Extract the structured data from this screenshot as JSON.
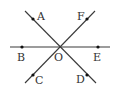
{
  "diagram": {
    "type": "intersecting-lines",
    "center": {
      "label": "O",
      "x": 60,
      "y": 47
    },
    "lines": [
      {
        "name": "line-BE",
        "from": [
          10,
          47
        ],
        "to": [
          110,
          47
        ],
        "through": [
          "B",
          "O",
          "E"
        ]
      },
      {
        "name": "line-AD",
        "from": [
          25,
          11
        ],
        "to": [
          96,
          83
        ],
        "through": [
          "A",
          "O",
          "D"
        ]
      },
      {
        "name": "line-FC",
        "from": [
          95,
          11
        ],
        "to": [
          25,
          83
        ],
        "through": [
          "F",
          "O",
          "C"
        ]
      }
    ],
    "points": [
      {
        "label": "A",
        "x": 33,
        "y": 19,
        "lx": 40,
        "ly": 19
      },
      {
        "label": "F",
        "x": 87,
        "y": 19,
        "lx": 80,
        "ly": 19
      },
      {
        "label": "B",
        "x": 22,
        "y": 47,
        "lx": 21,
        "ly": 61
      },
      {
        "label": "E",
        "x": 98,
        "y": 47,
        "lx": 98,
        "ly": 61
      },
      {
        "label": "C",
        "x": 33,
        "y": 75,
        "lx": 38,
        "ly": 84
      },
      {
        "label": "D",
        "x": 87,
        "y": 75,
        "lx": 79,
        "ly": 83
      }
    ],
    "labels": {
      "A": "A",
      "F": "F",
      "B": "B",
      "O": "O",
      "E": "E",
      "C": "C",
      "D": "D"
    },
    "colors": {
      "line": "#3a3a3a",
      "point": "#111111",
      "text": "#333333",
      "background": "#ffffff"
    }
  }
}
